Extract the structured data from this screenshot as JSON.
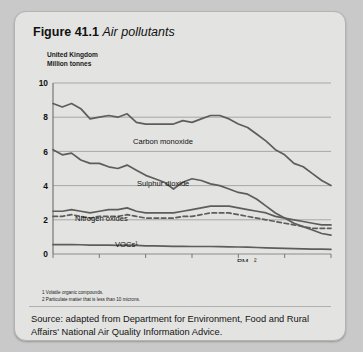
{
  "figure": {
    "number": "Figure 41.1",
    "name": "Air pollutants"
  },
  "chart_data": {
    "type": "line",
    "title": "Air pollutants",
    "region": "United Kingdom",
    "ylabel": "Million tonnes",
    "xlabel": "",
    "xlim": [
      1971,
      2001
    ],
    "ylim": [
      0,
      10
    ],
    "yticks": [
      0,
      2,
      4,
      6,
      8,
      10
    ],
    "xticks": [
      1971,
      1976,
      1981,
      1986,
      1991,
      1996,
      2001
    ],
    "grid": true,
    "legend": "inline-labels",
    "x": [
      1971,
      1972,
      1973,
      1974,
      1975,
      1976,
      1977,
      1978,
      1979,
      1980,
      1981,
      1982,
      1983,
      1984,
      1985,
      1986,
      1987,
      1988,
      1989,
      1990,
      1991,
      1992,
      1993,
      1994,
      1995,
      1996,
      1997,
      1998,
      1999,
      2000,
      2001
    ],
    "series": [
      {
        "name": "Carbon monoxide",
        "label": "Carbon monoxide",
        "style": "solid",
        "values": [
          8.8,
          8.6,
          8.8,
          8.5,
          7.9,
          8.0,
          8.1,
          8.0,
          8.2,
          7.7,
          7.6,
          7.6,
          7.6,
          7.6,
          7.8,
          7.7,
          7.9,
          8.1,
          8.1,
          7.9,
          7.6,
          7.4,
          7.0,
          6.6,
          6.1,
          5.8,
          5.3,
          5.1,
          4.7,
          4.3,
          4.0
        ]
      },
      {
        "name": "Sulphur dioxide",
        "label": "Sulphur dioxide",
        "style": "solid",
        "values": [
          6.1,
          5.8,
          5.9,
          5.5,
          5.3,
          5.3,
          5.1,
          5.0,
          5.2,
          4.9,
          4.6,
          4.4,
          4.2,
          3.8,
          4.2,
          4.4,
          4.3,
          4.1,
          4.0,
          3.8,
          3.6,
          3.5,
          3.2,
          2.8,
          2.4,
          2.1,
          1.8,
          1.6,
          1.4,
          1.2,
          1.1
        ]
      },
      {
        "name": "Nitrogen oxides",
        "label": "Nitrogen oxides",
        "style": "solid",
        "values": [
          2.5,
          2.5,
          2.6,
          2.5,
          2.4,
          2.5,
          2.6,
          2.6,
          2.7,
          2.5,
          2.4,
          2.4,
          2.4,
          2.4,
          2.5,
          2.6,
          2.7,
          2.8,
          2.8,
          2.8,
          2.7,
          2.6,
          2.5,
          2.4,
          2.2,
          2.1,
          2.0,
          1.9,
          1.8,
          1.7,
          1.7
        ]
      },
      {
        "name": "VOCs",
        "label": "VOCs¹",
        "style": "dashed",
        "values": [
          2.2,
          2.2,
          2.3,
          2.2,
          2.1,
          2.2,
          2.2,
          2.2,
          2.3,
          2.2,
          2.1,
          2.1,
          2.1,
          2.1,
          2.2,
          2.2,
          2.3,
          2.4,
          2.4,
          2.4,
          2.3,
          2.2,
          2.1,
          2.0,
          1.9,
          1.8,
          1.7,
          1.6,
          1.5,
          1.5,
          1.5
        ]
      },
      {
        "name": "PM10",
        "label": "PM₁₀²",
        "style": "solid",
        "values": [
          0.55,
          0.55,
          0.55,
          0.54,
          0.52,
          0.52,
          0.52,
          0.51,
          0.52,
          0.5,
          0.48,
          0.47,
          0.46,
          0.45,
          0.45,
          0.44,
          0.44,
          0.44,
          0.43,
          0.42,
          0.41,
          0.4,
          0.38,
          0.36,
          0.34,
          0.33,
          0.31,
          0.3,
          0.29,
          0.28,
          0.27
        ]
      }
    ]
  },
  "footnotes": [
    "1 Volatile organic compounds.",
    "2 Particulate matter that is less than 10 microns."
  ],
  "source": "Source: adapted from Department for Environment, Food and Rural Affairs' National Air Quality Information Advice."
}
